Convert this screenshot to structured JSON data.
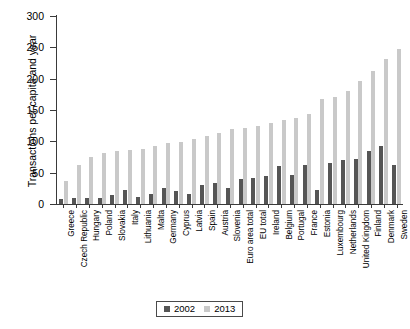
{
  "chart_data": {
    "type": "bar",
    "title": "",
    "xlabel": "",
    "ylabel": "Transactions per capita and year",
    "ylim": [
      0,
      300
    ],
    "yticks": [
      0,
      50,
      100,
      150,
      200,
      250,
      300
    ],
    "grid": false,
    "legend_position": "bottom-center",
    "categories": [
      "Greece",
      "Czech Republic",
      "Hungary",
      "Poland",
      "Slovakia",
      "Italy",
      "Lithuania",
      "Malta",
      "Germany",
      "Cyprus",
      "Latvia",
      "Spain",
      "Austria",
      "Slovenia",
      "Euro area total",
      "EU total",
      "Ireland",
      "Belgium",
      "Portugal",
      "France",
      "Estonia",
      "Luxembourg",
      "Netherlands",
      "United Kingdom",
      "Finland",
      "Denmark",
      "Sweden"
    ],
    "series": [
      {
        "name": "2002",
        "color": "#555555",
        "values": [
          8,
          10,
          9,
          9,
          14,
          22,
          11,
          16,
          25,
          20,
          16,
          30,
          33,
          26,
          40,
          41,
          44,
          60,
          47,
          62,
          22,
          66,
          70,
          72,
          84,
          92,
          63
        ]
      },
      {
        "name": "2013",
        "color": "#c9c9c9",
        "values": [
          36,
          62,
          75,
          82,
          85,
          86,
          88,
          93,
          97,
          99,
          104,
          108,
          113,
          119,
          122,
          124,
          130,
          134,
          138,
          143,
          168,
          170,
          181,
          196,
          213,
          232,
          248
        ]
      }
    ]
  },
  "legend": {
    "entries": [
      {
        "label": "2002",
        "color": "#555555"
      },
      {
        "label": "2013",
        "color": "#c9c9c9"
      }
    ]
  }
}
